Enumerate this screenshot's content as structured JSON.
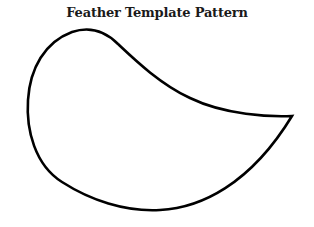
{
  "title": "Feather Template Pattern",
  "shape": {
    "name": "feather-outline",
    "stroke_color": "#000000",
    "fill_color": "#ffffff"
  }
}
